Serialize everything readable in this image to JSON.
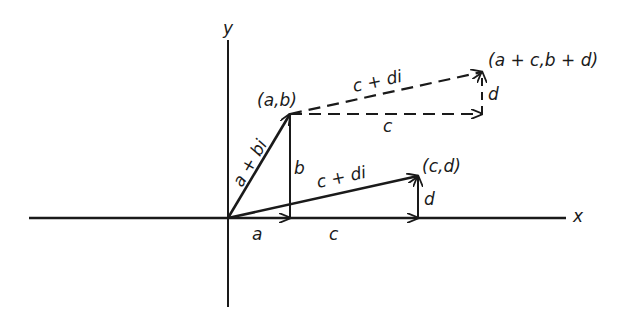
{
  "diagram": {
    "axes": {
      "x_label": "x",
      "y_label": "y"
    },
    "points": {
      "ab": "(a,b)",
      "cd": "(c,d)",
      "sum": "(a + c,b + d)"
    },
    "vectors": {
      "a_plus_bi": "a + bi",
      "c_plus_di": "c + di",
      "c_plus_di_translated": "c + di"
    },
    "segments": {
      "a": "a",
      "b": "b",
      "c_axis": "c",
      "d_vertical": "d",
      "c_dashed": "c",
      "d_dashed": "d"
    },
    "colors": {
      "ink": "#1a1a1a",
      "background": "#ffffff"
    }
  }
}
